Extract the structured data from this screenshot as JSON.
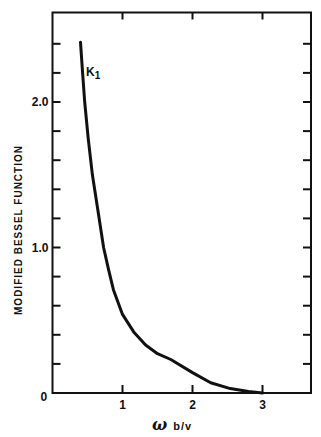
{
  "chart_data": {
    "type": "line",
    "title": "",
    "xlabel": "ω b/v",
    "xlabel_parts": {
      "symbol": "ω",
      "rest": "b/v"
    },
    "ylabel": "MODIFIED BESSEL FUNCTION",
    "xlim": [
      0,
      3.7
    ],
    "ylim": [
      0,
      2.6
    ],
    "grid": false,
    "legend": "none",
    "x_ticks": [
      {
        "value": 0,
        "label": "0"
      },
      {
        "value": 1,
        "label": "1"
      },
      {
        "value": 2,
        "label": "2"
      },
      {
        "value": 3,
        "label": "3"
      }
    ],
    "y_ticks": [
      {
        "value": 0,
        "label": "0"
      },
      {
        "value": 0.2,
        "label": ""
      },
      {
        "value": 0.4,
        "label": ""
      },
      {
        "value": 0.6,
        "label": ""
      },
      {
        "value": 0.8,
        "label": ""
      },
      {
        "value": 1.0,
        "label": "1.0"
      },
      {
        "value": 1.2,
        "label": ""
      },
      {
        "value": 1.4,
        "label": ""
      },
      {
        "value": 1.6,
        "label": ""
      },
      {
        "value": 1.8,
        "label": ""
      },
      {
        "value": 2.0,
        "label": "2.0"
      },
      {
        "value": 2.2,
        "label": ""
      },
      {
        "value": 2.4,
        "label": ""
      }
    ],
    "series": [
      {
        "name": "K1",
        "label_main": "K",
        "label_sub": "1",
        "x": [
          0.4,
          0.43,
          0.46,
          0.51,
          0.57,
          0.65,
          0.73,
          0.8,
          0.87,
          1.0,
          1.16,
          1.33,
          1.5,
          1.69,
          2.0,
          2.26,
          2.54,
          2.8,
          3.0
        ],
        "values": [
          2.41,
          2.2,
          2.0,
          1.75,
          1.5,
          1.25,
          1.0,
          0.85,
          0.71,
          0.54,
          0.42,
          0.33,
          0.27,
          0.23,
          0.14,
          0.07,
          0.03,
          0.01,
          0.0
        ]
      }
    ]
  }
}
